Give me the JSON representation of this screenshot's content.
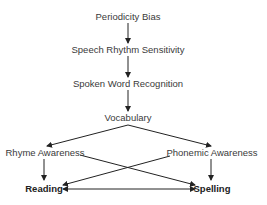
{
  "diagram": {
    "type": "flowchart",
    "nodes": {
      "periodicity_bias": "Periodicity Bias",
      "speech_rhythm": "Speech Rhythm Sensitivity",
      "spoken_word": "Spoken Word Recognition",
      "vocabulary": "Vocabulary",
      "rhyme_awareness": "Rhyme Awareness",
      "phonemic_awareness": "Phonemic Awareness",
      "reading": "Reading",
      "spelling": "Spelling"
    },
    "edges": [
      {
        "from": "Periodicity Bias",
        "to": "Speech Rhythm Sensitivity"
      },
      {
        "from": "Speech Rhythm Sensitivity",
        "to": "Spoken Word Recognition"
      },
      {
        "from": "Spoken Word Recognition",
        "to": "Vocabulary"
      },
      {
        "from": "Vocabulary",
        "to": "Rhyme Awareness"
      },
      {
        "from": "Vocabulary",
        "to": "Phonemic Awareness"
      },
      {
        "from": "Rhyme Awareness",
        "to": "Reading"
      },
      {
        "from": "Rhyme Awareness",
        "to": "Spelling"
      },
      {
        "from": "Phonemic Awareness",
        "to": "Reading"
      },
      {
        "from": "Phonemic Awareness",
        "to": "Spelling"
      },
      {
        "from": "Reading",
        "to": "Spelling",
        "bidirectional": true
      }
    ],
    "colors": {
      "line": "#222222",
      "text": "#3a3a3a"
    }
  }
}
